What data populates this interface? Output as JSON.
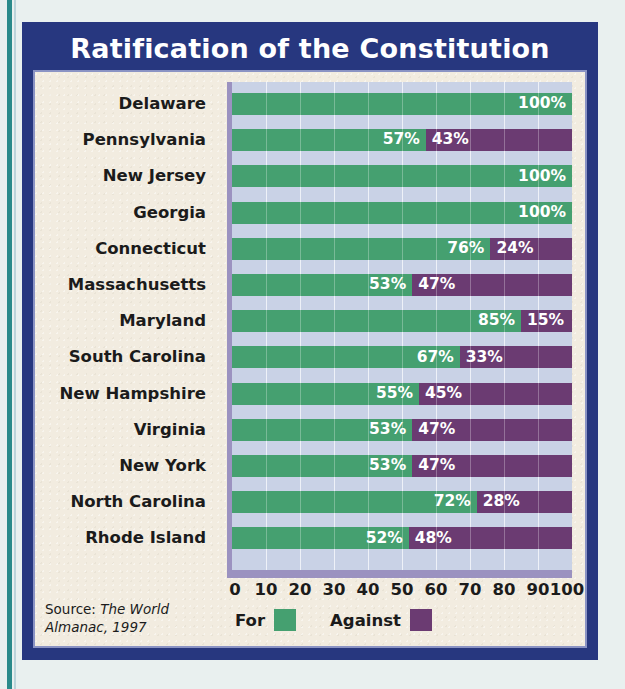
{
  "title": "Ratification of the Constitution",
  "colors": {
    "frame": "#27377f",
    "card": "#f2ece0",
    "plot_bg": "#c9d2e6",
    "for": "#45a070",
    "against": "#6b3b72",
    "bevel": "#9b92c0",
    "title_text": "#ffffff",
    "text": "#1b1b1b",
    "edge_rule": "#2a8a8a"
  },
  "source": {
    "prefix": "Source: ",
    "work": "The World Almanac, 1997",
    "full": "Source: The World Almanac, 1997"
  },
  "legend": {
    "for_label": "For",
    "against_label": "Against"
  },
  "chart_data": {
    "type": "bar",
    "orientation": "horizontal",
    "stacked": true,
    "percent_stacked": true,
    "title": "Ratification of the Constitution",
    "xlabel": "",
    "ylabel": "",
    "xlim": [
      0,
      100
    ],
    "xticks": [
      0,
      10,
      20,
      30,
      40,
      50,
      60,
      70,
      80,
      90,
      100
    ],
    "xtick_labels": [
      "0",
      "10",
      "20",
      "30",
      "40",
      "50",
      "60",
      "70",
      "80",
      "90",
      "100"
    ],
    "grid": true,
    "legend_position": "bottom",
    "categories": [
      "Delaware",
      "Pennsylvania",
      "New Jersey",
      "Georgia",
      "Connecticut",
      "Massachusetts",
      "Maryland",
      "South Carolina",
      "New Hampshire",
      "Virginia",
      "New York",
      "North Carolina",
      "Rhode Island"
    ],
    "series": [
      {
        "name": "For",
        "color": "#45a070",
        "values": [
          100,
          57,
          100,
          100,
          76,
          53,
          85,
          67,
          55,
          53,
          53,
          72,
          52
        ]
      },
      {
        "name": "Against",
        "color": "#6b3b72",
        "values": [
          0,
          43,
          0,
          0,
          24,
          47,
          15,
          33,
          45,
          47,
          47,
          28,
          48
        ]
      }
    ],
    "data_labels": [
      {
        "state": "Delaware",
        "for": "100%",
        "against": ""
      },
      {
        "state": "Pennsylvania",
        "for": "57%",
        "against": "43%"
      },
      {
        "state": "New Jersey",
        "for": "100%",
        "against": ""
      },
      {
        "state": "Georgia",
        "for": "100%",
        "against": ""
      },
      {
        "state": "Connecticut",
        "for": "76%",
        "against": "24%"
      },
      {
        "state": "Massachusetts",
        "for": "53%",
        "against": "47%"
      },
      {
        "state": "Maryland",
        "for": "85%",
        "against": "15%"
      },
      {
        "state": "South Carolina",
        "for": "67%",
        "against": "33%"
      },
      {
        "state": "New Hampshire",
        "for": "55%",
        "against": "45%"
      },
      {
        "state": "Virginia",
        "for": "53%",
        "against": "47%"
      },
      {
        "state": "New York",
        "for": "53%",
        "against": "47%"
      },
      {
        "state": "North Carolina",
        "for": "72%",
        "against": "28%"
      },
      {
        "state": "Rhode Island",
        "for": "52%",
        "against": "48%"
      }
    ]
  }
}
